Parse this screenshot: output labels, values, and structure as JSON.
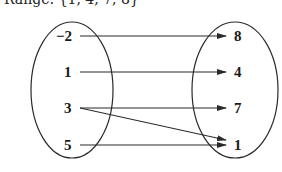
{
  "caption": {
    "text": "Range: {1, 4, 7, 8}"
  },
  "domain_set": {
    "elements": [
      "−2",
      "1",
      "3",
      "5"
    ]
  },
  "range_set": {
    "elements": [
      "8",
      "4",
      "7",
      "1"
    ]
  },
  "mappings": [
    {
      "from": "−2",
      "to": "8"
    },
    {
      "from": "1",
      "to": "4"
    },
    {
      "from": "3",
      "to": "7"
    },
    {
      "from": "3",
      "to": "1"
    },
    {
      "from": "5",
      "to": "1"
    }
  ],
  "colors": {
    "stroke": "#2a2a2a",
    "text": "#1a1a1a",
    "background": "#ffffff"
  }
}
